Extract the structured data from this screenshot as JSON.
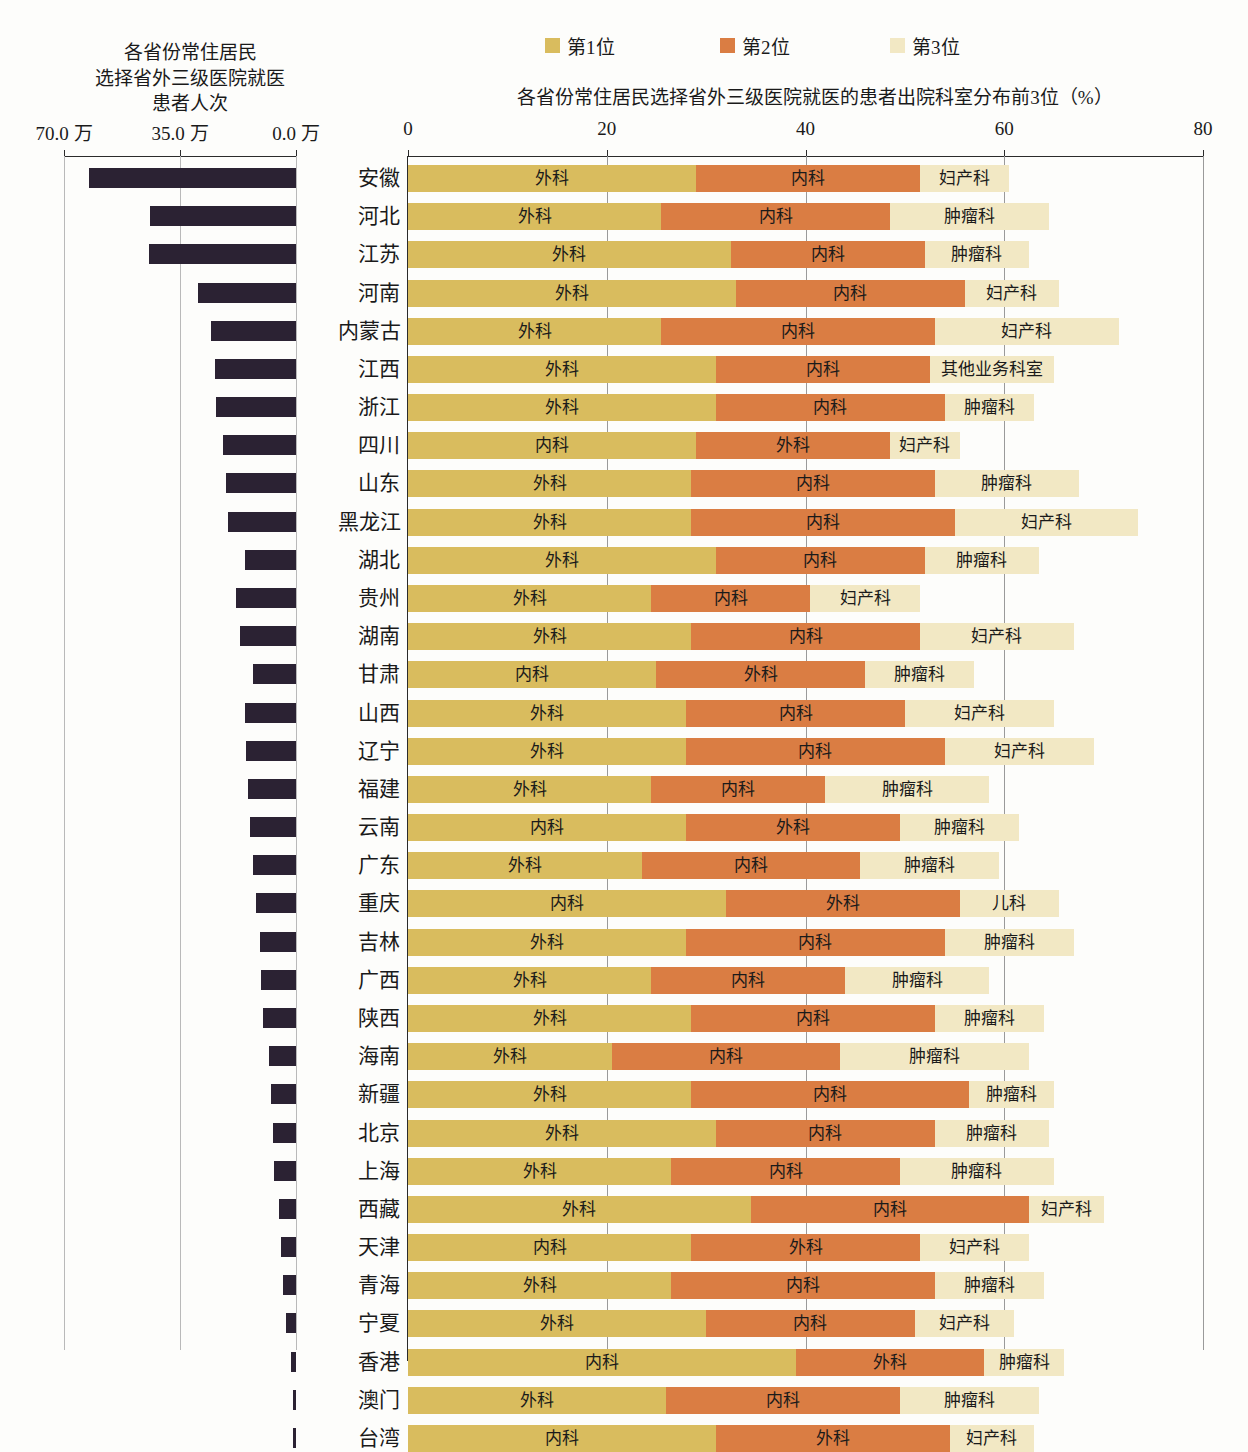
{
  "legend": {
    "items": [
      {
        "label": "第1位",
        "color": "#d9bc5e"
      },
      {
        "label": "第2位",
        "color": "#da7d43"
      },
      {
        "label": "第3位",
        "color": "#f2e8c4"
      }
    ]
  },
  "left_panel": {
    "title_lines": [
      "各省份常住居民",
      "选择省外三级医院就医",
      "患者人次"
    ],
    "tick_labels": [
      "70.0 万",
      "35.0 万",
      "0.0 万"
    ],
    "axis_max": 70.0,
    "axis_unit": "万"
  },
  "right_panel": {
    "title": "各省份常住居民选择省外三级医院就医的患者出院科室分布前3位（%）",
    "tick_labels": [
      "0",
      "20",
      "40",
      "60",
      "80"
    ],
    "axis_max": 80
  },
  "chart_data": {
    "type": "bar",
    "title": "各省份常住居民选择省外三级医院就医的患者出院科室分布前3位（%）",
    "subtitle": "各省份常住居民选择省外三级医院就医患者人次",
    "orientation": "horizontal",
    "stacked": true,
    "grid": true,
    "legend_position": "top",
    "xlabel": "",
    "ylabel": "",
    "xlim_left": [
      70.0,
      0.0
    ],
    "xlim_right": [
      0,
      80
    ],
    "left_series_name": "患者人次（万）",
    "left_ticks": [
      70.0,
      35.0,
      0.0
    ],
    "right_ticks": [
      0,
      20,
      40,
      60,
      80
    ],
    "categories": [
      "安徽",
      "河北",
      "江苏",
      "河南",
      "内蒙古",
      "江西",
      "浙江",
      "四川",
      "山东",
      "黑龙江",
      "湖北",
      "贵州",
      "湖南",
      "甘肃",
      "山西",
      "辽宁",
      "福建",
      "云南",
      "广东",
      "重庆",
      "吉林",
      "广西",
      "陕西",
      "海南",
      "新疆",
      "北京",
      "上海",
      "西藏",
      "天津",
      "青海",
      "宁夏",
      "香港",
      "澳门",
      "台湾"
    ],
    "rows": [
      {
        "province": "安徽",
        "visits_wan": 62.5,
        "segments": [
          {
            "rank": 1,
            "label": "外科",
            "value": 29.0
          },
          {
            "rank": 2,
            "label": "内科",
            "value": 22.5
          },
          {
            "rank": 3,
            "label": "妇产科",
            "value": 9.0
          }
        ]
      },
      {
        "province": "河北",
        "visits_wan": 44.0,
        "segments": [
          {
            "rank": 1,
            "label": "外科",
            "value": 25.5
          },
          {
            "rank": 2,
            "label": "内科",
            "value": 23.0
          },
          {
            "rank": 3,
            "label": "肿瘤科",
            "value": 16.0
          }
        ]
      },
      {
        "province": "江苏",
        "visits_wan": 44.5,
        "segments": [
          {
            "rank": 1,
            "label": "外科",
            "value": 32.5
          },
          {
            "rank": 2,
            "label": "内科",
            "value": 19.5
          },
          {
            "rank": 3,
            "label": "肿瘤科",
            "value": 10.5
          }
        ]
      },
      {
        "province": "河南",
        "visits_wan": 29.5,
        "segments": [
          {
            "rank": 1,
            "label": "外科",
            "value": 33.0
          },
          {
            "rank": 2,
            "label": "内科",
            "value": 23.0
          },
          {
            "rank": 3,
            "label": "妇产科",
            "value": 9.5
          }
        ]
      },
      {
        "province": "内蒙古",
        "visits_wan": 25.5,
        "segments": [
          {
            "rank": 1,
            "label": "外科",
            "value": 25.5
          },
          {
            "rank": 2,
            "label": "内科",
            "value": 27.5
          },
          {
            "rank": 3,
            "label": "妇产科",
            "value": 18.5
          }
        ]
      },
      {
        "province": "江西",
        "visits_wan": 24.5,
        "segments": [
          {
            "rank": 1,
            "label": "外科",
            "value": 31.0
          },
          {
            "rank": 2,
            "label": "内科",
            "value": 21.5
          },
          {
            "rank": 3,
            "label": "其他业务科室",
            "value": 12.5
          }
        ]
      },
      {
        "province": "浙江",
        "visits_wan": 24.0,
        "segments": [
          {
            "rank": 1,
            "label": "外科",
            "value": 31.0
          },
          {
            "rank": 2,
            "label": "内科",
            "value": 23.0
          },
          {
            "rank": 3,
            "label": "肿瘤科",
            "value": 9.0
          }
        ]
      },
      {
        "province": "四川",
        "visits_wan": 22.0,
        "segments": [
          {
            "rank": 1,
            "label": "内科",
            "value": 29.0
          },
          {
            "rank": 2,
            "label": "外科",
            "value": 19.5
          },
          {
            "rank": 3,
            "label": "妇产科",
            "value": 7.0
          }
        ]
      },
      {
        "province": "山东",
        "visits_wan": 21.0,
        "segments": [
          {
            "rank": 1,
            "label": "外科",
            "value": 28.5
          },
          {
            "rank": 2,
            "label": "内科",
            "value": 24.5
          },
          {
            "rank": 3,
            "label": "肿瘤科",
            "value": 14.5
          }
        ]
      },
      {
        "province": "黑龙江",
        "visits_wan": 20.5,
        "segments": [
          {
            "rank": 1,
            "label": "外科",
            "value": 28.5
          },
          {
            "rank": 2,
            "label": "内科",
            "value": 26.5
          },
          {
            "rank": 3,
            "label": "妇产科",
            "value": 18.5
          }
        ]
      },
      {
        "province": "湖北",
        "visits_wan": 15.5,
        "segments": [
          {
            "rank": 1,
            "label": "外科",
            "value": 31.0
          },
          {
            "rank": 2,
            "label": "内科",
            "value": 21.0
          },
          {
            "rank": 3,
            "label": "肿瘤科",
            "value": 11.5
          }
        ]
      },
      {
        "province": "贵州",
        "visits_wan": 18.0,
        "segments": [
          {
            "rank": 1,
            "label": "外科",
            "value": 24.5
          },
          {
            "rank": 2,
            "label": "内科",
            "value": 16.0
          },
          {
            "rank": 3,
            "label": "妇产科",
            "value": 11.0
          }
        ]
      },
      {
        "province": "湖南",
        "visits_wan": 17.0,
        "segments": [
          {
            "rank": 1,
            "label": "外科",
            "value": 28.5
          },
          {
            "rank": 2,
            "label": "内科",
            "value": 23.0
          },
          {
            "rank": 3,
            "label": "妇产科",
            "value": 15.5
          }
        ]
      },
      {
        "province": "甘肃",
        "visits_wan": 13.0,
        "segments": [
          {
            "rank": 1,
            "label": "内科",
            "value": 25.0
          },
          {
            "rank": 2,
            "label": "外科",
            "value": 21.0
          },
          {
            "rank": 3,
            "label": "肿瘤科",
            "value": 11.0
          }
        ]
      },
      {
        "province": "山西",
        "visits_wan": 15.5,
        "segments": [
          {
            "rank": 1,
            "label": "外科",
            "value": 28.0
          },
          {
            "rank": 2,
            "label": "内科",
            "value": 22.0
          },
          {
            "rank": 3,
            "label": "妇产科",
            "value": 15.0
          }
        ]
      },
      {
        "province": "辽宁",
        "visits_wan": 15.0,
        "segments": [
          {
            "rank": 1,
            "label": "外科",
            "value": 28.0
          },
          {
            "rank": 2,
            "label": "内科",
            "value": 26.0
          },
          {
            "rank": 3,
            "label": "妇产科",
            "value": 15.0
          }
        ]
      },
      {
        "province": "福建",
        "visits_wan": 14.5,
        "segments": [
          {
            "rank": 1,
            "label": "外科",
            "value": 24.5
          },
          {
            "rank": 2,
            "label": "内科",
            "value": 17.5
          },
          {
            "rank": 3,
            "label": "肿瘤科",
            "value": 16.5
          }
        ]
      },
      {
        "province": "云南",
        "visits_wan": 14.0,
        "segments": [
          {
            "rank": 1,
            "label": "内科",
            "value": 28.0
          },
          {
            "rank": 2,
            "label": "外科",
            "value": 21.5
          },
          {
            "rank": 3,
            "label": "肿瘤科",
            "value": 12.0
          }
        ]
      },
      {
        "province": "广东",
        "visits_wan": 13.0,
        "segments": [
          {
            "rank": 1,
            "label": "外科",
            "value": 23.5
          },
          {
            "rank": 2,
            "label": "内科",
            "value": 22.0
          },
          {
            "rank": 3,
            "label": "肿瘤科",
            "value": 14.0
          }
        ]
      },
      {
        "province": "重庆",
        "visits_wan": 12.0,
        "segments": [
          {
            "rank": 1,
            "label": "内科",
            "value": 32.0
          },
          {
            "rank": 2,
            "label": "外科",
            "value": 23.5
          },
          {
            "rank": 3,
            "label": "儿科",
            "value": 10.0
          }
        ]
      },
      {
        "province": "吉林",
        "visits_wan": 11.0,
        "segments": [
          {
            "rank": 1,
            "label": "外科",
            "value": 28.0
          },
          {
            "rank": 2,
            "label": "内科",
            "value": 26.0
          },
          {
            "rank": 3,
            "label": "肿瘤科",
            "value": 13.0
          }
        ]
      },
      {
        "province": "广西",
        "visits_wan": 10.5,
        "segments": [
          {
            "rank": 1,
            "label": "外科",
            "value": 24.5
          },
          {
            "rank": 2,
            "label": "内科",
            "value": 19.5
          },
          {
            "rank": 3,
            "label": "肿瘤科",
            "value": 14.5
          }
        ]
      },
      {
        "province": "陕西",
        "visits_wan": 10.0,
        "segments": [
          {
            "rank": 1,
            "label": "外科",
            "value": 28.5
          },
          {
            "rank": 2,
            "label": "内科",
            "value": 24.5
          },
          {
            "rank": 3,
            "label": "肿瘤科",
            "value": 11.0
          }
        ]
      },
      {
        "province": "海南",
        "visits_wan": 8.0,
        "segments": [
          {
            "rank": 1,
            "label": "外科",
            "value": 20.5
          },
          {
            "rank": 2,
            "label": "内科",
            "value": 23.0
          },
          {
            "rank": 3,
            "label": "肿瘤科",
            "value": 19.0
          }
        ]
      },
      {
        "province": "新疆",
        "visits_wan": 7.5,
        "segments": [
          {
            "rank": 1,
            "label": "外科",
            "value": 28.5
          },
          {
            "rank": 2,
            "label": "内科",
            "value": 28.0
          },
          {
            "rank": 3,
            "label": "肿瘤科",
            "value": 8.5
          }
        ]
      },
      {
        "province": "北京",
        "visits_wan": 7.0,
        "segments": [
          {
            "rank": 1,
            "label": "外科",
            "value": 31.0
          },
          {
            "rank": 2,
            "label": "内科",
            "value": 22.0
          },
          {
            "rank": 3,
            "label": "肿瘤科",
            "value": 11.5
          }
        ]
      },
      {
        "province": "上海",
        "visits_wan": 6.5,
        "segments": [
          {
            "rank": 1,
            "label": "外科",
            "value": 26.5
          },
          {
            "rank": 2,
            "label": "内科",
            "value": 23.0
          },
          {
            "rank": 3,
            "label": "肿瘤科",
            "value": 15.5
          }
        ]
      },
      {
        "province": "西藏",
        "visits_wan": 5.0,
        "segments": [
          {
            "rank": 1,
            "label": "外科",
            "value": 34.5
          },
          {
            "rank": 2,
            "label": "内科",
            "value": 28.0
          },
          {
            "rank": 3,
            "label": "妇产科",
            "value": 7.5
          }
        ]
      },
      {
        "province": "天津",
        "visits_wan": 4.5,
        "segments": [
          {
            "rank": 1,
            "label": "内科",
            "value": 28.5
          },
          {
            "rank": 2,
            "label": "外科",
            "value": 23.0
          },
          {
            "rank": 3,
            "label": "妇产科",
            "value": 11.0
          }
        ]
      },
      {
        "province": "青海",
        "visits_wan": 4.0,
        "segments": [
          {
            "rank": 1,
            "label": "外科",
            "value": 26.5
          },
          {
            "rank": 2,
            "label": "内科",
            "value": 26.5
          },
          {
            "rank": 3,
            "label": "肿瘤科",
            "value": 11.0
          }
        ]
      },
      {
        "province": "宁夏",
        "visits_wan": 3.0,
        "segments": [
          {
            "rank": 1,
            "label": "外科",
            "value": 30.0
          },
          {
            "rank": 2,
            "label": "内科",
            "value": 21.0
          },
          {
            "rank": 3,
            "label": "妇产科",
            "value": 10.0
          }
        ]
      },
      {
        "province": "香港",
        "visits_wan": 1.5,
        "segments": [
          {
            "rank": 1,
            "label": "内科",
            "value": 39.0
          },
          {
            "rank": 2,
            "label": "外科",
            "value": 19.0
          },
          {
            "rank": 3,
            "label": "肿瘤科",
            "value": 8.0
          }
        ]
      },
      {
        "province": "澳门",
        "visits_wan": 1.0,
        "segments": [
          {
            "rank": 1,
            "label": "外科",
            "value": 26.0
          },
          {
            "rank": 2,
            "label": "内科",
            "value": 23.5
          },
          {
            "rank": 3,
            "label": "肿瘤科",
            "value": 14.0
          }
        ]
      },
      {
        "province": "台湾",
        "visits_wan": 0.8,
        "segments": [
          {
            "rank": 1,
            "label": "内科",
            "value": 31.0
          },
          {
            "rank": 2,
            "label": "外科",
            "value": 23.5
          },
          {
            "rank": 3,
            "label": "妇产科",
            "value": 8.5
          }
        ]
      }
    ]
  },
  "caption": ""
}
